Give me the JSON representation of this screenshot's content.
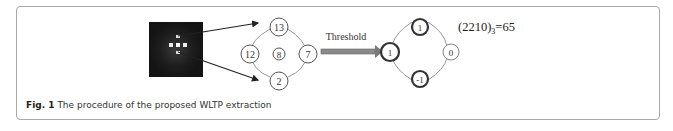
{
  "figure": {
    "caption_label": "Fig. 1",
    "caption_text": "The procedure of the proposed WLTP extraction",
    "arrow_label": "Threshold",
    "formula_main": "(2210)",
    "formula_sub": "3",
    "formula_result": "=65",
    "neighborhood": {
      "top": "13",
      "left": "12",
      "center": "8",
      "right": "7",
      "bottom": "2"
    },
    "thresholded": {
      "top": "1",
      "left": "1",
      "right": "0",
      "bottom": "-1"
    },
    "colors": {
      "border": "#a8a8a8",
      "arrow": "#7a7a7a",
      "dark_image": "#151515"
    }
  }
}
